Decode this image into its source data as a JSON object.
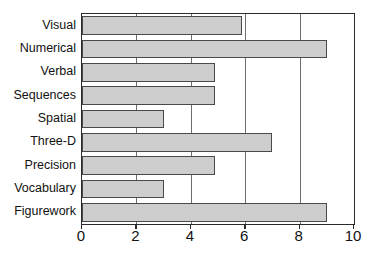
{
  "chart_data": {
    "type": "bar",
    "orientation": "horizontal",
    "title": "",
    "subtitle": "",
    "xlabel": "",
    "ylabel": "",
    "categories": [
      "Visual",
      "Numerical",
      "Verbal",
      "Sequences",
      "Spatial",
      "Three-D",
      "Precision",
      "Vocabulary",
      "Figurework"
    ],
    "values": [
      5.9,
      9.0,
      4.9,
      4.9,
      3.0,
      7.0,
      4.9,
      3.0,
      9.0
    ],
    "series": [
      {
        "name": "Score",
        "values": [
          5.9,
          9.0,
          4.9,
          4.9,
          3.0,
          7.0,
          4.9,
          3.0,
          9.0
        ]
      }
    ],
    "xlim": [
      0,
      10
    ],
    "xticks": [
      0,
      2,
      4,
      6,
      8,
      10
    ],
    "xtick_labels": [
      "0",
      "2",
      "4",
      "6",
      "8",
      "10"
    ],
    "gridlines": {
      "vertical_at": [
        2,
        4,
        6,
        8
      ],
      "horizontal": false
    },
    "legend": {
      "visible": false,
      "position": "none",
      "entries": []
    },
    "colors": {
      "bar_fill": "#cdcdcd",
      "bar_stroke": "#4a4a4a",
      "axis": "#2b2b2b",
      "gridline": "#6e6e6e",
      "background": "#ffffff",
      "text": "#111111"
    },
    "annotations": []
  }
}
